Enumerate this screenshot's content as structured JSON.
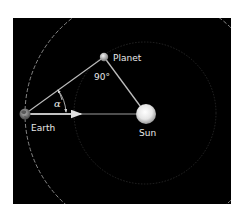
{
  "diagram": {
    "type": "elongation-geometry",
    "background": "#000000",
    "labels": {
      "planet": "Planet",
      "earth": "Earth",
      "sun": "Sun",
      "right_angle": "90°",
      "angle": "α"
    },
    "colors": {
      "line": "#c8c8c8",
      "orbit": "#bdbdbd",
      "inner_orbit": "#3a3a3a",
      "text": "#e8e8e8",
      "sun": "#f0f0f0",
      "planet": "#cfcfcf",
      "earth": "#8a8a8a"
    }
  }
}
